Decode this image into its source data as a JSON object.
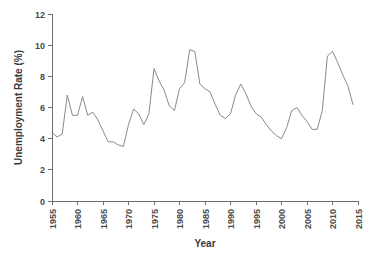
{
  "chart_data": {
    "type": "line",
    "title": "",
    "xlabel": "Year",
    "ylabel": "Unemployment Rate (%)",
    "xlim": [
      1955,
      2015
    ],
    "ylim": [
      0,
      12
    ],
    "grid": false,
    "legend": "none",
    "line_color": "#8a8a8a",
    "axis_color": "#6e6e6e",
    "background_color": "#ffffff",
    "xticks": [
      "1955",
      "1960",
      "1965",
      "1970",
      "1975",
      "1980",
      "1985",
      "1990",
      "1995",
      "2000",
      "2005",
      "2010",
      "2015"
    ],
    "xtick_values": [
      1955,
      1960,
      1965,
      1970,
      1975,
      1980,
      1985,
      1990,
      1995,
      2000,
      2005,
      2010,
      2015
    ],
    "xtick_rotation": 90,
    "yticks": [
      "0",
      "2",
      "4",
      "6",
      "8",
      "10",
      "12"
    ],
    "ytick_values": [
      0,
      2,
      4,
      6,
      8,
      10,
      12
    ],
    "series": [
      {
        "name": "Unemployment Rate",
        "x": [
          1955,
          1956,
          1957,
          1958,
          1959,
          1960,
          1961,
          1962,
          1963,
          1964,
          1965,
          1966,
          1967,
          1968,
          1969,
          1970,
          1971,
          1972,
          1973,
          1974,
          1975,
          1976,
          1977,
          1978,
          1979,
          1980,
          1981,
          1982,
          1983,
          1984,
          1985,
          1986,
          1987,
          1988,
          1989,
          1990,
          1991,
          1992,
          1993,
          1994,
          1995,
          1996,
          1997,
          1998,
          1999,
          2000,
          2001,
          2002,
          2003,
          2004,
          2005,
          2006,
          2007,
          2008,
          2009,
          2010,
          2011,
          2012,
          2013,
          2014
        ],
        "values": [
          4.4,
          4.1,
          4.3,
          6.8,
          5.5,
          5.5,
          6.7,
          5.5,
          5.7,
          5.2,
          4.5,
          3.8,
          3.8,
          3.6,
          3.5,
          4.9,
          5.9,
          5.6,
          4.9,
          5.6,
          8.5,
          7.7,
          7.1,
          6.1,
          5.8,
          7.2,
          7.6,
          9.7,
          9.6,
          7.5,
          7.2,
          7.0,
          6.2,
          5.5,
          5.3,
          5.6,
          6.8,
          7.5,
          6.9,
          6.1,
          5.6,
          5.4,
          4.9,
          4.5,
          4.2,
          4.0,
          4.7,
          5.8,
          6.0,
          5.5,
          5.1,
          4.6,
          4.6,
          5.8,
          9.3,
          9.6,
          8.9,
          8.1,
          7.4,
          6.2
        ]
      }
    ]
  },
  "figure": {
    "plot_area": {
      "left": 52,
      "right": 358,
      "top": 14,
      "bottom": 201
    }
  }
}
